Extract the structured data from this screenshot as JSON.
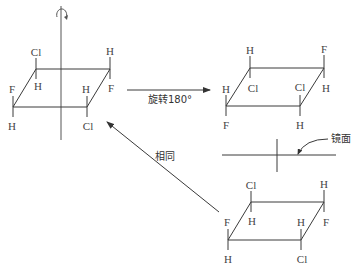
{
  "diagram": {
    "rotate_label": "旋转180°",
    "same_label": "相同",
    "mirror_label": "镜面",
    "colors": {
      "line": "#3a3a3a",
      "text": "#444444",
      "background": "#ffffff"
    },
    "molecules": [
      {
        "id": "original",
        "vertices": {
          "tl": [
            36,
            69
          ],
          "tr": [
            110,
            69
          ],
          "br": [
            87,
            107
          ],
          "bl": [
            13,
            107
          ]
        },
        "atoms": {
          "tl_up": "Cl",
          "tl_down": "H",
          "tr_up": "H",
          "tr_down": "F",
          "bl_up": "F",
          "bl_down": "H",
          "br_up": "H",
          "br_down": "Cl"
        }
      },
      {
        "id": "rotated",
        "vertices": {
          "tl": [
            250,
            68
          ],
          "tr": [
            324,
            68
          ],
          "br": [
            300,
            106
          ],
          "bl": [
            226,
            106
          ]
        },
        "atoms": {
          "tl_up": "H",
          "tl_down": "Cl",
          "tr_up": "F",
          "tr_down": "H",
          "bl_up": "H",
          "bl_down": "F",
          "br_up": "Cl",
          "br_down": "H"
        }
      },
      {
        "id": "mirror-image",
        "vertices": {
          "tl": [
            251,
            202
          ],
          "tr": [
            324,
            202
          ],
          "br": [
            301,
            240
          ],
          "bl": [
            228,
            240
          ]
        },
        "atoms": {
          "tl_up": "Cl",
          "tl_down": "H",
          "tr_up": "H",
          "tr_down": "F",
          "bl_up": "F",
          "bl_down": "H",
          "br_up": "H",
          "br_down": "Cl"
        }
      }
    ]
  }
}
